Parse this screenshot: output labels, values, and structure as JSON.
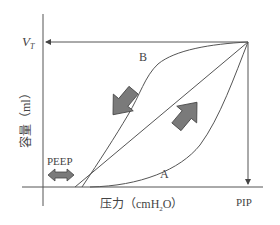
{
  "diagram": {
    "y_axis_label": "容量（ml）",
    "x_axis_label_prefix": "压力（cmH",
    "x_axis_label_sub": "2",
    "x_axis_label_suffix": "O）",
    "vt_label_main": "V",
    "vt_label_sub": "T",
    "pip_label": "PIP",
    "peep_label": "PEEP",
    "curve_a_label": "A",
    "curve_b_label": "B",
    "colors": {
      "line": "#555555",
      "arrow_fill": "#7a7a7a",
      "text": "#444444"
    }
  }
}
